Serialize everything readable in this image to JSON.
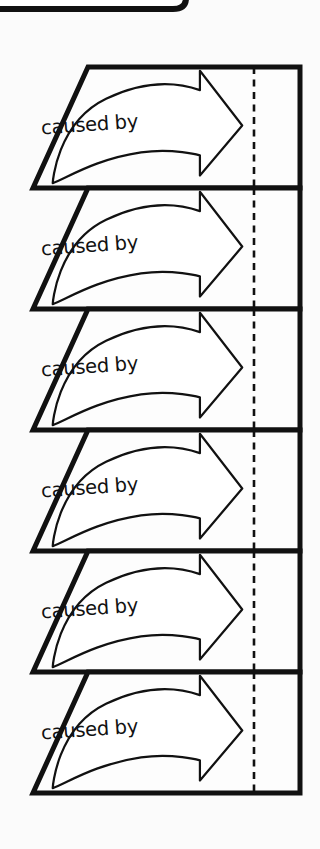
{
  "diagram": {
    "background_color": "#fbfbfb",
    "stroke_color": "#111111",
    "fill_color": "#ffffff",
    "canvas": {
      "width": 320,
      "height": 849
    },
    "top_partial_shape": {
      "name": "rounded-rectangle-cut-off",
      "visible_portion": "bottom edge only",
      "right_edge_x": 186,
      "bottom_y": 12
    },
    "panel_geometry": {
      "count": 6,
      "first_top_y": 67,
      "panel_height": 121,
      "top_left_x": 88,
      "bottom_left_x": 33,
      "right_x": 300,
      "dashed_line_x": 254
    },
    "panels": [
      {
        "index": 1,
        "label": "caused by",
        "arrow": "curved-arrow-right"
      },
      {
        "index": 2,
        "label": "caused by",
        "arrow": "curved-arrow-right"
      },
      {
        "index": 3,
        "label": "caused by",
        "arrow": "curved-arrow-right"
      },
      {
        "index": 4,
        "label": "caused by",
        "arrow": "curved-arrow-right"
      },
      {
        "index": 5,
        "label": "caused by",
        "arrow": "curved-arrow-right"
      },
      {
        "index": 6,
        "label": "caused by",
        "arrow": "curved-arrow-right"
      }
    ]
  }
}
